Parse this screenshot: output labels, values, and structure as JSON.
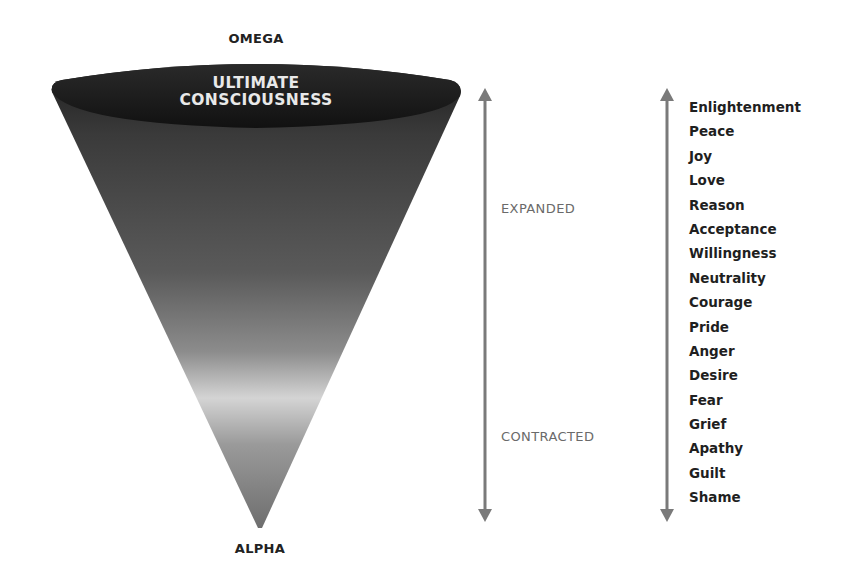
{
  "diagram": {
    "top_label": "OMEGA",
    "bottom_label": "ALPHA",
    "cap_label_line1": "ULTIMATE",
    "cap_label_line2": "CONSCIOUSNESS",
    "cone": {
      "shape": "inverted-cone",
      "gradient_stops": [
        {
          "offset": 0.0,
          "color": "#1e1e1e"
        },
        {
          "offset": 0.15,
          "color": "#3a3a3a"
        },
        {
          "offset": 0.45,
          "color": "#5a5a5a"
        },
        {
          "offset": 0.62,
          "color": "#8c8c8c"
        },
        {
          "offset": 0.72,
          "color": "#d4d4d4"
        },
        {
          "offset": 0.82,
          "color": "#9a9a9a"
        },
        {
          "offset": 1.0,
          "color": "#6e6e6e"
        }
      ]
    },
    "axis": {
      "upper_label": "EXPANDED",
      "lower_label": "CONTRACTED",
      "arrow_color": "#7a7a7a",
      "direction": "bidirectional"
    },
    "scale_arrow": {
      "arrow_color": "#7a7a7a",
      "direction": "bidirectional"
    },
    "levels": [
      "Enlightenment",
      "Peace",
      "Joy",
      "Love",
      "Reason",
      "Acceptance",
      "Willingness",
      "Neutrality",
      "Courage",
      "Pride",
      "Anger",
      "Desire",
      "Fear",
      "Grief",
      "Apathy",
      "Guilt",
      "Shame"
    ]
  }
}
